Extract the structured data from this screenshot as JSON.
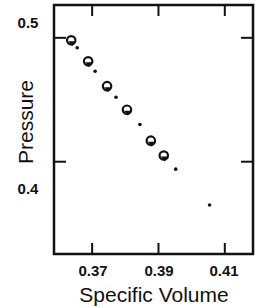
{
  "chart_data": {
    "type": "scatter",
    "title": "",
    "xlabel": "Specific Volume",
    "ylabel": "Pressure",
    "xlim": [
      0.3585,
      0.4185
    ],
    "ylim": [
      0.3255,
      0.5265
    ],
    "xticks": [
      0.37,
      0.39,
      0.41
    ],
    "xtick_labels": [
      "0.37",
      "0.39",
      "0.41"
    ],
    "yticks": [
      0.4,
      0.5
    ],
    "ytick_labels": [
      "0.4",
      "0.5"
    ],
    "grid": false,
    "legend": null,
    "series": [
      {
        "name": "open-circle-with-marker",
        "marker": "circle",
        "x": [
          0.3637,
          0.3688,
          0.3745,
          0.3805,
          0.3877,
          0.3916
        ],
        "y": [
          0.498,
          0.481,
          0.461,
          0.442,
          0.417,
          0.405
        ]
      },
      {
        "name": "dot",
        "marker": "dot",
        "x": [
          0.3655,
          0.3709,
          0.3772,
          0.3844,
          0.3952,
          0.4054
        ],
        "y": [
          0.492,
          0.473,
          0.452,
          0.43,
          0.394,
          0.365
        ]
      }
    ]
  },
  "labels": {
    "xlabel": "Specific Volume",
    "ylabel": "Pressure",
    "xticks": [
      "0.37",
      "0.39",
      "0.41"
    ],
    "yticks": [
      "0.4",
      "0.5"
    ]
  }
}
